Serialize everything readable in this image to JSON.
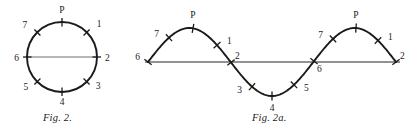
{
  "plate": {
    "background_color": "#ffffff",
    "ink_color": "#1a1a1a",
    "axis_color": "#6e6e6e",
    "width": 405,
    "height": 133
  },
  "figures": [
    {
      "id": "fig-2",
      "caption": "Fig. 2.",
      "kind": "circle-diagram",
      "geometry": {
        "center_x": 62,
        "center_y": 57,
        "radius": 35,
        "diameter_line": {
          "x1": 27,
          "y1": 57,
          "x2": 97,
          "y2": 57
        }
      },
      "points": [
        {
          "name": "P",
          "label": "P",
          "angle_deg": 90,
          "label_dx": 0,
          "label_dy": -9,
          "anchor": "middle"
        },
        {
          "name": "1",
          "label": "1",
          "angle_deg": 45,
          "label_dx": 10,
          "label_dy": -5,
          "anchor": "start"
        },
        {
          "name": "2",
          "label": "2",
          "angle_deg": 0,
          "label_dx": 8,
          "label_dy": 4,
          "anchor": "start"
        },
        {
          "name": "3",
          "label": "3",
          "angle_deg": -45,
          "label_dx": 9,
          "label_dy": 7,
          "anchor": "start"
        },
        {
          "name": "4",
          "label": "4",
          "angle_deg": -90,
          "label_dx": 0,
          "label_dy": 13,
          "anchor": "middle"
        },
        {
          "name": "5",
          "label": "5",
          "angle_deg": -135,
          "label_dx": -9,
          "label_dy": 8,
          "anchor": "end"
        },
        {
          "name": "6",
          "label": "6",
          "angle_deg": 180,
          "label_dx": -8,
          "label_dy": 4,
          "anchor": "end"
        },
        {
          "name": "7",
          "label": "7",
          "angle_deg": 135,
          "label_dx": -10,
          "label_dy": -4,
          "anchor": "end"
        }
      ]
    },
    {
      "id": "fig-2a",
      "caption": "Fig. 2a.",
      "kind": "sine-wave-diagram",
      "geometry": {
        "baseline_y": 62,
        "baseline_x1": 145,
        "baseline_x2": 400,
        "wave_start_x": 148,
        "wave_end_x": 396,
        "amplitude": 34,
        "cycles": 1.5,
        "peak_y": 28,
        "trough_y": 96
      },
      "points": [
        {
          "name": "6-start",
          "label": "6",
          "x": 148,
          "y": 62,
          "label_dx": -8,
          "label_dy": -2,
          "anchor": "end"
        },
        {
          "name": "7-first",
          "label": "7",
          "x": 169,
          "y": 38,
          "label_dx": -10,
          "label_dy": -1,
          "anchor": "end"
        },
        {
          "name": "P-first",
          "label": "P",
          "x": 193,
          "y": 28,
          "label_dx": 0,
          "label_dy": -10,
          "anchor": "middle"
        },
        {
          "name": "1-first",
          "label": "1",
          "x": 217,
          "y": 38,
          "label_dx": 10,
          "label_dy": -1,
          "anchor": "start"
        },
        {
          "name": "2-first",
          "label": "2",
          "x": 231,
          "y": 62,
          "label_dx": 4,
          "label_dy": -3,
          "anchor": "start"
        },
        {
          "name": "3",
          "label": "3",
          "x": 252,
          "y": 86,
          "label_dx": -10,
          "label_dy": 6,
          "anchor": "end"
        },
        {
          "name": "4",
          "label": "4",
          "x": 272,
          "y": 96,
          "label_dx": 0,
          "label_dy": 15,
          "anchor": "middle"
        },
        {
          "name": "5",
          "label": "5",
          "x": 294,
          "y": 86,
          "label_dx": 10,
          "label_dy": 6,
          "anchor": "start"
        },
        {
          "name": "6-mid",
          "label": "6",
          "x": 314,
          "y": 62,
          "label_dx": 3,
          "label_dy": 11,
          "anchor": "start"
        },
        {
          "name": "7-second",
          "label": "7",
          "x": 333,
          "y": 38,
          "label_dx": -10,
          "label_dy": -1,
          "anchor": "end"
        },
        {
          "name": "P-second",
          "label": "P",
          "x": 356,
          "y": 28,
          "label_dx": 0,
          "label_dy": -10,
          "anchor": "middle"
        },
        {
          "name": "1-second",
          "label": "1",
          "x": 378,
          "y": 38,
          "label_dx": 10,
          "label_dy": -1,
          "anchor": "start"
        },
        {
          "name": "2-end",
          "label": "2",
          "x": 396,
          "y": 62,
          "label_dx": 4,
          "label_dy": -3,
          "anchor": "start"
        }
      ]
    }
  ]
}
